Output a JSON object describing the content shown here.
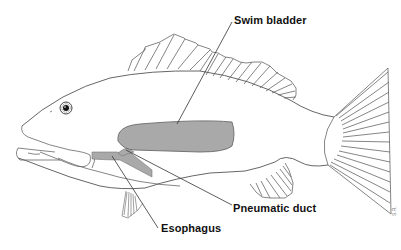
{
  "diagram": {
    "labels": [
      {
        "id": "swim_bladder",
        "text": "Swim bladder"
      },
      {
        "id": "pneumatic_duct",
        "text": "Pneumatic duct"
      },
      {
        "id": "esophagus",
        "text": "Esophagus"
      }
    ],
    "signature": "S.R.",
    "colors": {
      "outline": "#555555",
      "organ_fill": "#a9a9a9",
      "organ_stroke": "#6a6a6a",
      "leader_line": "#333333",
      "label_text": "#111111",
      "background": "#ffffff"
    }
  }
}
